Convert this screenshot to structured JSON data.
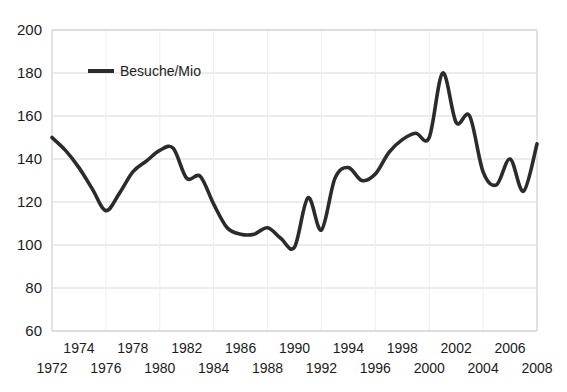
{
  "chart_data": {
    "type": "line",
    "title": "",
    "xlabel": "",
    "ylabel": "",
    "legend": [
      "Besuche/Mio"
    ],
    "legend_position": "inside-top-left",
    "grid": true,
    "xlim": [
      1972,
      2008
    ],
    "ylim": [
      60,
      200
    ],
    "yticks": [
      60,
      80,
      100,
      120,
      140,
      160,
      180,
      200
    ],
    "xticks": [
      1972,
      1973,
      1974,
      1975,
      1976,
      1977,
      1978,
      1979,
      1980,
      1981,
      1982,
      1983,
      1984,
      1985,
      1986,
      1987,
      1988,
      1989,
      1990,
      1991,
      1992,
      1993,
      1994,
      1995,
      1996,
      1997,
      1998,
      1999,
      2000,
      2001,
      2002,
      2003,
      2004,
      2005,
      2006,
      2007,
      2008
    ],
    "xtick_labels_upper": [
      "1974",
      "1978",
      "1982",
      "1986",
      "1990",
      "1994",
      "1998",
      "2002",
      "2006"
    ],
    "xtick_labels_lower": [
      "1972",
      "1976",
      "1980",
      "1984",
      "1988",
      "1992",
      "1996",
      "2000",
      "2004",
      "2008"
    ],
    "x": [
      1972,
      1973,
      1974,
      1975,
      1976,
      1977,
      1978,
      1979,
      1980,
      1981,
      1982,
      1983,
      1984,
      1985,
      1986,
      1987,
      1988,
      1989,
      1990,
      1991,
      1992,
      1993,
      1994,
      1995,
      1996,
      1997,
      1998,
      1999,
      2000,
      2001,
      2002,
      2003,
      2004,
      2005,
      2006,
      2007,
      2008
    ],
    "series": [
      {
        "name": "Besuche/Mio",
        "color": "#2b2b2b",
        "values": [
          150,
          144,
          136,
          126,
          116,
          124,
          134,
          139,
          144,
          145,
          131,
          132,
          119,
          108,
          105,
          105,
          108,
          103,
          99,
          122,
          107,
          131,
          136,
          130,
          133,
          143,
          149,
          152,
          150,
          180,
          157,
          160,
          134,
          128,
          140,
          125,
          147
        ]
      }
    ]
  },
  "axis": {
    "y_tick_labels": [
      "200",
      "180",
      "160",
      "140",
      "120",
      "100",
      "80",
      "60"
    ],
    "x_upper_labels": [
      "1974",
      "1978",
      "1982",
      "1986",
      "1990",
      "1994",
      "1998",
      "2002",
      "2006"
    ],
    "x_lower_labels": [
      "1972",
      "1976",
      "1980",
      "1984",
      "1988",
      "1992",
      "1996",
      "2000",
      "2004",
      "2008"
    ]
  },
  "legend": {
    "label": "Besuche/Mio",
    "color": "#2b2b2b"
  }
}
